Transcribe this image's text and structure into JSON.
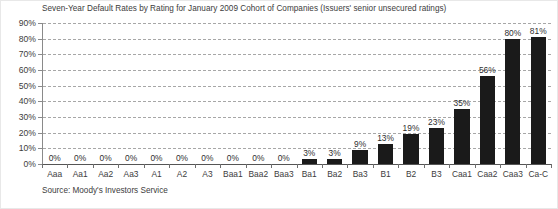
{
  "chart_data": {
    "type": "bar",
    "title": "Seven-Year Default Rates by Rating for January 2009 Cohort of Companies (Issuers' senior unsecured ratings)",
    "xlabel": "",
    "ylabel": "",
    "ylim": [
      0,
      90
    ],
    "ytick_labels": [
      "90%",
      "80%",
      "70%",
      "60%",
      "50%",
      "40%",
      "30%",
      "20%",
      "10%",
      "0%"
    ],
    "ytick_values": [
      90,
      80,
      70,
      60,
      50,
      40,
      30,
      20,
      10,
      0
    ],
    "grid": true,
    "legend": "none",
    "bar_color": "#1a1a1a",
    "categories": [
      "Aaa",
      "Aa1",
      "Aa2",
      "Aa3",
      "A1",
      "A2",
      "A3",
      "Baa1",
      "Baa2",
      "Baa3",
      "Ba1",
      "Ba2",
      "Ba3",
      "B1",
      "B2",
      "B3",
      "Caa1",
      "Caa2",
      "Caa3",
      "Ca-C"
    ],
    "values": [
      0,
      0,
      0,
      0,
      0,
      0,
      0,
      0,
      0,
      0,
      3,
      3,
      9,
      13,
      19,
      23,
      35,
      56,
      80,
      81
    ],
    "data_labels": [
      "0%",
      "0%",
      "0%",
      "0%",
      "0%",
      "0%",
      "0%",
      "0%",
      "0%",
      "0%",
      "3%",
      "3%",
      "9%",
      "13%",
      "19%",
      "23%",
      "35%",
      "56%",
      "80%",
      "81%"
    ],
    "annotations": [
      "Source: Moody's Investors Service"
    ]
  },
  "source_note": "Source: Moody's Investors Service"
}
